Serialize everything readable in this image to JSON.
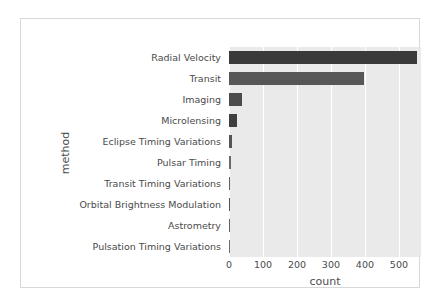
{
  "figure": {
    "background": "#ffffff",
    "border_color": "#d8d8d8",
    "plot_background": "#eaeaea",
    "grid_color": "#ffffff"
  },
  "chart_data": {
    "type": "bar",
    "orientation": "horizontal",
    "title": "",
    "xlabel": "count",
    "ylabel": "method",
    "xlim": [
      0,
      565
    ],
    "xticks": [
      0,
      100,
      200,
      300,
      400,
      500
    ],
    "xtick_labels": [
      "0",
      "100",
      "200",
      "300",
      "400",
      "500"
    ],
    "grid": true,
    "grid_axis": "x",
    "legend": false,
    "categories": [
      "Radial Velocity",
      "Transit",
      "Imaging",
      "Microlensing",
      "Eclipse Timing Variations",
      "Pulsar Timing",
      "Transit Timing Variations",
      "Orbital Brightness Modulation",
      "Astrometry",
      "Pulsation Timing Variations"
    ],
    "values": [
      553,
      397,
      38,
      23,
      9,
      5,
      4,
      3,
      2,
      1
    ],
    "bar_colors": [
      "#3a3a3a",
      "#575757",
      "#4b4b4b",
      "#3f3f3f",
      "#555555",
      "#6a6a6a",
      "#5e5e5e",
      "#525252",
      "#606060",
      "#6e6e6e"
    ]
  }
}
